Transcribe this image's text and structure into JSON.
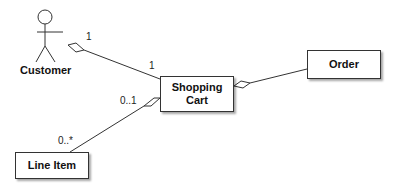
{
  "diagram": {
    "type": "UML class diagram",
    "actor": {
      "label": "Customer"
    },
    "classes": [
      {
        "id": "shopping-cart",
        "label_line1": "Shopping",
        "label_line2": "Cart"
      },
      {
        "id": "order",
        "label": "Order"
      },
      {
        "id": "line-item",
        "label": "Line Item"
      }
    ],
    "associations": [
      {
        "from": "Customer",
        "to": "Shopping Cart",
        "aggregation_end": "Customer",
        "mult_from": "1",
        "mult_to": "1"
      },
      {
        "from": "Shopping Cart",
        "to": "Order",
        "aggregation_end": "Shopping Cart"
      },
      {
        "from": "Shopping Cart",
        "to": "Line Item",
        "aggregation_end": "Shopping Cart",
        "mult_from": "0..1",
        "mult_to": "0..*"
      }
    ]
  },
  "colors": {
    "line": "#333333",
    "box_border": "#333333",
    "text": "#111111"
  }
}
